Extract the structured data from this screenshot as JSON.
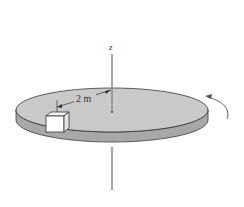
{
  "figure": {
    "axis_label": "z",
    "distance_label": "2 m",
    "colors": {
      "disc_top": "#c9c9c9",
      "disc_side": "#a8a8a8",
      "axis": "#8a8a8a",
      "stroke": "#333333",
      "box_front": "#ffffff",
      "box_side": "#e6e6e6"
    }
  }
}
